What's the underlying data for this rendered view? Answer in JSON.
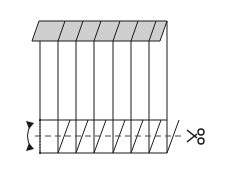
{
  "diagram": {
    "colors": {
      "line": "#1a1a1a",
      "shade": "#cfcfcf",
      "background": "#ffffff"
    },
    "top_band": {
      "y_top": 21,
      "y_bottom": 41,
      "x_top_left": 39,
      "x_bottom_left": 32,
      "x_top_right": 167,
      "x_bottom_right": 160
    },
    "vertical_lines_x": [
      40,
      58,
      76,
      94,
      113,
      131,
      149,
      167
    ],
    "body": {
      "y_top": 41,
      "y_bottom": 153
    },
    "fold_band": {
      "y_top": 120,
      "y_bottom": 153
    },
    "cut_line": {
      "y": 136,
      "x_start": 35,
      "x_end": 183
    },
    "scissors_icon": "scissors",
    "fold_arrow_icon": "curved-double-arrow"
  }
}
